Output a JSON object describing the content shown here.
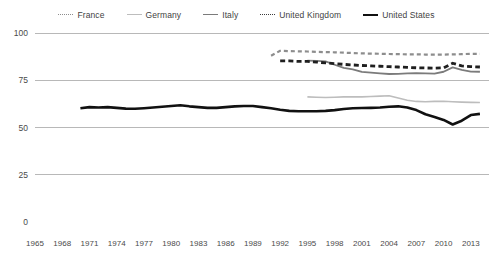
{
  "chart_data": {
    "type": "line",
    "title": "",
    "subtitle": "",
    "xlabel": "",
    "ylabel": "",
    "xlim": [
      1965,
      2015
    ],
    "ylim": [
      0,
      100
    ],
    "grid": true,
    "legend_position": "top-center",
    "y_ticks": [
      0,
      25,
      50,
      75,
      100
    ],
    "y_tick_labels": [
      "0",
      "25",
      "50",
      "75",
      "100"
    ],
    "x_ticks": [
      1965,
      1968,
      1971,
      1974,
      1977,
      1980,
      1983,
      1986,
      1989,
      1992,
      1995,
      1998,
      2001,
      2004,
      2007,
      2010,
      2013
    ],
    "x_tick_labels": [
      "1965",
      "1968",
      "1971",
      "1974",
      "1977",
      "1980",
      "1983",
      "1986",
      "1989",
      "1992",
      "1995",
      "1998",
      "2001",
      "2004",
      "2007",
      "2010",
      "2013"
    ],
    "series": [
      {
        "name": "France",
        "color": "#8d8d8d",
        "style": "dotted",
        "width": 2.2,
        "x": [
          1991,
          1992,
          1993,
          1994,
          1995,
          1996,
          1997,
          1998,
          1999,
          2000,
          2001,
          2002,
          2003,
          2004,
          2005,
          2006,
          2007,
          2008,
          2009,
          2010,
          2011,
          2012,
          2013,
          2014
        ],
        "values": [
          88.0,
          90.6,
          90.4,
          90.3,
          90.2,
          90.0,
          89.9,
          89.8,
          89.6,
          89.4,
          89.2,
          89.1,
          89.0,
          88.9,
          88.8,
          88.7,
          88.7,
          88.6,
          88.6,
          88.6,
          88.7,
          88.8,
          89.0,
          89.0
        ]
      },
      {
        "name": "Germany",
        "color": "#bdbdbd",
        "style": "solid",
        "width": 1.6,
        "x": [
          1995,
          1996,
          1997,
          1998,
          1999,
          2000,
          2001,
          2002,
          2003,
          2004,
          2005,
          2006,
          2007,
          2008,
          2009,
          2010,
          2011,
          2012,
          2013,
          2014
        ],
        "values": [
          66.2,
          66.0,
          65.9,
          66.0,
          66.2,
          66.3,
          66.2,
          66.4,
          66.6,
          66.8,
          65.6,
          64.4,
          63.8,
          63.6,
          63.8,
          63.9,
          63.6,
          63.4,
          63.3,
          63.2
        ]
      },
      {
        "name": "Italy",
        "color": "#7b7b7b",
        "style": "solid",
        "width": 1.8,
        "x": [
          1995,
          1996,
          1997,
          1998,
          1999,
          2000,
          2001,
          2002,
          2003,
          2004,
          2005,
          2006,
          2007,
          2008,
          2009,
          2010,
          2011,
          2012,
          2013,
          2014
        ],
        "values": [
          85.4,
          85.3,
          85.0,
          83.2,
          81.5,
          80.8,
          79.4,
          79.0,
          78.6,
          78.3,
          78.4,
          78.6,
          78.7,
          78.6,
          78.5,
          79.5,
          81.8,
          80.5,
          79.6,
          79.5
        ]
      },
      {
        "name": "United Kingdom",
        "color": "#1f1f1f",
        "style": "dotted",
        "width": 2.8,
        "x": [
          1992,
          1993,
          1994,
          1995,
          1996,
          1997,
          1998,
          1999,
          2000,
          2001,
          2002,
          2003,
          2004,
          2005,
          2006,
          2007,
          2008,
          2009,
          2010,
          2011,
          2012,
          2013,
          2014
        ],
        "values": [
          85.2,
          85.2,
          85.0,
          85.0,
          84.6,
          84.2,
          83.8,
          83.4,
          83.1,
          82.8,
          82.6,
          82.4,
          82.2,
          82.0,
          81.8,
          81.6,
          81.5,
          81.4,
          81.6,
          84.0,
          82.6,
          82.2,
          82.0
        ]
      },
      {
        "name": "United States",
        "color": "#111111",
        "style": "solid",
        "width": 2.6,
        "x": [
          1970,
          1971,
          1972,
          1973,
          1974,
          1975,
          1976,
          1977,
          1978,
          1979,
          1980,
          1981,
          1982,
          1983,
          1984,
          1985,
          1986,
          1987,
          1988,
          1989,
          1990,
          1991,
          1992,
          1993,
          1994,
          1995,
          1996,
          1997,
          1998,
          1999,
          2000,
          2001,
          2002,
          2003,
          2004,
          2005,
          2006,
          2007,
          2008,
          2009,
          2010,
          2011,
          2012,
          2013,
          2014
        ],
        "values": [
          60.2,
          60.8,
          60.6,
          60.8,
          60.4,
          60.0,
          59.9,
          60.2,
          60.6,
          61.0,
          61.4,
          61.8,
          61.2,
          60.8,
          60.4,
          60.4,
          60.8,
          61.2,
          61.4,
          61.4,
          60.8,
          60.2,
          59.4,
          58.8,
          58.6,
          58.6,
          58.6,
          58.8,
          59.2,
          59.8,
          60.2,
          60.3,
          60.4,
          60.6,
          61.0,
          61.2,
          60.6,
          59.2,
          57.0,
          55.6,
          54.0,
          51.6,
          53.6,
          56.6,
          57.2
        ]
      }
    ]
  },
  "legend": {
    "items": [
      {
        "label": "France",
        "key": "france"
      },
      {
        "label": "Germany",
        "key": "germany"
      },
      {
        "label": "Italy",
        "key": "italy"
      },
      {
        "label": "United Kingdom",
        "key": "uk"
      },
      {
        "label": "United States",
        "key": "us"
      }
    ]
  },
  "colors": {
    "france": "#8d8d8d",
    "germany": "#bdbdbd",
    "italy": "#7b7b7b",
    "united_kingdom": "#1f1f1f",
    "united_states": "#111111",
    "gridline": "#9a9a9a",
    "text": "#4a4a4a",
    "background": "#ffffff"
  }
}
